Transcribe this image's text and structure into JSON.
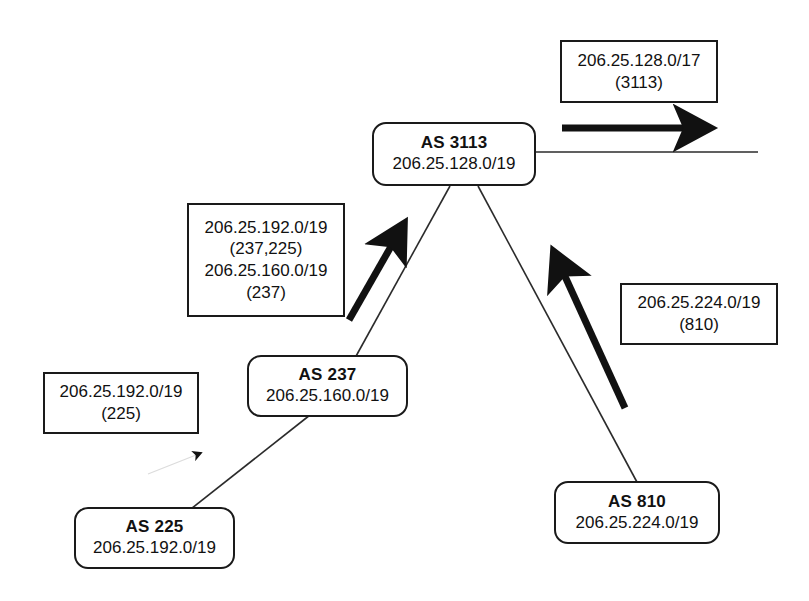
{
  "diagram": {
    "stroke_color": "#1a1a1a",
    "background_color": "#ffffff",
    "nodes": [
      {
        "id": "as3113",
        "name": "AS 3113",
        "prefix": "206.25.128.0/19"
      },
      {
        "id": "as237",
        "name": "AS 237",
        "prefix": "206.25.160.0/19"
      },
      {
        "id": "as225",
        "name": "AS 225",
        "prefix": "206.25.192.0/19"
      },
      {
        "id": "as810",
        "name": "AS 810",
        "prefix": "206.25.224.0/19"
      }
    ],
    "annotations": [
      {
        "id": "ann-3113-upstream",
        "lines": [
          "206.25.128.0/17",
          "(3113)"
        ]
      },
      {
        "id": "ann-237-to-3113",
        "lines": [
          "206.25.192.0/19",
          "(237,225)",
          "206.25.160.0/19",
          "(237)"
        ]
      },
      {
        "id": "ann-225-to-237",
        "lines": [
          "206.25.192.0/19",
          "(225)"
        ]
      },
      {
        "id": "ann-810-to-3113",
        "lines": [
          "206.25.224.0/19",
          "(810)"
        ]
      }
    ],
    "links": [
      {
        "id": "link-3113-237",
        "from": "as3113",
        "to": "as237",
        "style": "thin"
      },
      {
        "id": "link-3113-810",
        "from": "as3113",
        "to": "as810",
        "style": "thin"
      },
      {
        "id": "link-237-225",
        "from": "as237",
        "to": "as225",
        "style": "thin"
      },
      {
        "id": "link-3113-upstream",
        "from": "as3113",
        "to": "upstream",
        "style": "thin-horizontal"
      }
    ],
    "advertisement_arrows": [
      {
        "id": "arrow-3113-upstream",
        "direction": "right",
        "weight": "bold"
      },
      {
        "id": "arrow-237-to-3113",
        "direction": "up-right",
        "weight": "bold"
      },
      {
        "id": "arrow-810-to-3113",
        "direction": "up-left",
        "weight": "bold"
      },
      {
        "id": "arrow-225-to-237",
        "direction": "up-right",
        "weight": "thin"
      }
    ]
  }
}
